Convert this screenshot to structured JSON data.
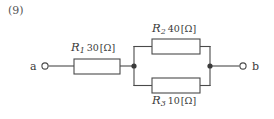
{
  "problem": {
    "number": "(9)"
  },
  "terminals": [
    {
      "name": "a",
      "label": "a",
      "cx": 45,
      "cy": 66
    },
    {
      "name": "b",
      "label": "b",
      "cx": 243,
      "cy": 66
    }
  ],
  "resistors": [
    {
      "name": "R1",
      "symbol": "R",
      "subscript": "1",
      "value": "30",
      "unit": "[Ω]",
      "label_full": "R1 30[Ω]",
      "position": "series-left",
      "box": {
        "x": 74,
        "y": 59,
        "w": 46,
        "h": 15
      }
    },
    {
      "name": "R2",
      "symbol": "R",
      "subscript": "2",
      "value": "40",
      "unit": "[Ω]",
      "label_full": "R2 40[Ω]",
      "position": "parallel-top",
      "box": {
        "x": 152,
        "y": 39,
        "w": 48,
        "h": 15
      }
    },
    {
      "name": "R3",
      "symbol": "R",
      "subscript": "3",
      "value": "10",
      "unit": "[Ω]",
      "label_full": "R3 10[Ω]",
      "position": "parallel-bottom",
      "box": {
        "x": 152,
        "y": 78,
        "w": 48,
        "h": 15
      }
    }
  ],
  "junctions": [
    {
      "name": "left-node",
      "cx": 134,
      "cy": 66
    },
    {
      "name": "right-node",
      "cx": 210,
      "cy": 66
    }
  ],
  "colors": {
    "background": "#ffffff",
    "wire": "#4a4a4a",
    "box_stroke": "#4a4a4a",
    "box_fill": "#ffffff",
    "text": "#3a3a3a"
  }
}
